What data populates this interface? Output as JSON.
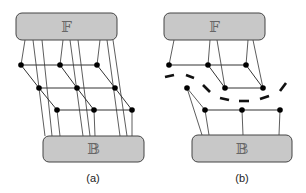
{
  "panels": [
    {
      "id": "a",
      "caption": "(a)",
      "top_box": {
        "label": "𝔽",
        "x": 16,
        "y": 13,
        "w": 101,
        "h": 27
      },
      "bottom_box": {
        "label": "𝔹",
        "x": 43,
        "y": 136,
        "w": 101,
        "h": 26
      },
      "nodes": [
        [
          21,
          65
        ],
        [
          60,
          65
        ],
        [
          97,
          65
        ],
        [
          39,
          88
        ],
        [
          77,
          88
        ],
        [
          115,
          88
        ],
        [
          57,
          110
        ],
        [
          94,
          110
        ],
        [
          132,
          110
        ]
      ]
    },
    {
      "id": "b",
      "caption": "(b)",
      "top_box": {
        "label": "𝔽",
        "x": 164,
        "y": 13,
        "w": 101,
        "h": 27
      },
      "bottom_box": {
        "label": "𝔹",
        "x": 192,
        "y": 135,
        "w": 100,
        "h": 27
      },
      "nodes": [
        [
          169,
          65
        ],
        [
          208,
          65
        ],
        [
          246,
          65
        ],
        [
          225,
          88
        ],
        [
          263,
          88
        ],
        [
          187,
          88
        ],
        [
          205,
          110
        ],
        [
          242,
          110
        ],
        [
          280,
          110
        ]
      ],
      "cut_style": "dashed"
    }
  ],
  "colors": {
    "box_fill": "#c8c8c8",
    "box_stroke": "#444444",
    "node": "#000000",
    "edge": "#333333"
  }
}
